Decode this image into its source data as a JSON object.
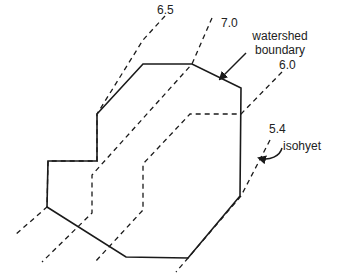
{
  "diagram": {
    "type": "watershed-isohyet-map",
    "colors": {
      "stroke": "#1a1a1a",
      "background": "#ffffff"
    },
    "watershed": {
      "label_line1": "watershed",
      "label_line2": "boundary",
      "polygon": [
        [
          143,
          64
        ],
        [
          192,
          64
        ],
        [
          241,
          88
        ],
        [
          240,
          196
        ],
        [
          188,
          258
        ],
        [
          126,
          257
        ],
        [
          47,
          207
        ],
        [
          48,
          161
        ],
        [
          97,
          161
        ],
        [
          97,
          114
        ]
      ]
    },
    "isohyets": [
      {
        "value": "6.5",
        "label_pos": [
          165,
          8
        ],
        "points": [
          [
            165,
            16
          ],
          [
            143,
            40
          ],
          [
            97,
            114
          ],
          [
            97,
            161
          ],
          [
            48,
            161
          ],
          [
            47,
            207
          ],
          [
            15,
            235
          ]
        ]
      },
      {
        "value": "7.0",
        "label_pos": [
          212,
          8
        ],
        "points": [
          [
            212,
            18
          ],
          [
            192,
            64
          ],
          [
            92,
            175
          ],
          [
            92,
            213
          ],
          [
            42,
            262
          ]
        ]
      },
      {
        "value": "6.0",
        "label_pos": [
          282,
          62
        ],
        "points": [
          [
            282,
            72
          ],
          [
            241,
            114
          ],
          [
            190,
            114
          ],
          [
            143,
            164
          ],
          [
            143,
            210
          ],
          [
            95,
            262
          ]
        ]
      },
      {
        "value": "5.4",
        "label_pos": [
          270,
          120
        ],
        "points": [
          [
            270,
            140
          ],
          [
            241,
            196
          ],
          [
            188,
            258
          ],
          [
            176,
            272
          ]
        ]
      }
    ],
    "annotations": {
      "isohyet_label": "isohyet",
      "watershed_arrow": {
        "from": [
          246,
          53
        ],
        "to": [
          218,
          80
        ]
      },
      "isohyet_arrow": {
        "from": [
          282,
          150
        ],
        "to": [
          258,
          158
        ]
      }
    }
  }
}
